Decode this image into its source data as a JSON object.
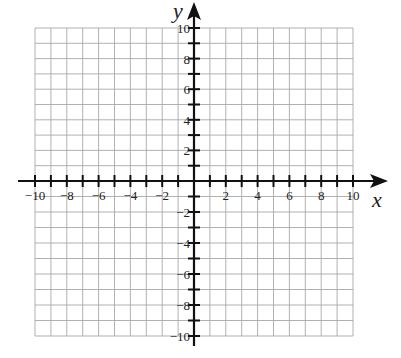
{
  "chart_data": {
    "type": "coordinate-grid",
    "title": "",
    "xlabel": "x",
    "ylabel": "y",
    "xlim": [
      -10,
      10
    ],
    "ylim": [
      -10,
      10
    ],
    "grid": true,
    "grid_step": 1,
    "x_tick_labels": [
      "-10",
      "-8",
      "-6",
      "-4",
      "-2",
      "2",
      "4",
      "6",
      "8",
      "10"
    ],
    "y_tick_labels": [
      "10",
      "8",
      "6",
      "4",
      "2",
      "-2",
      "-4",
      "-6",
      "-8",
      "-10"
    ],
    "series": []
  },
  "colors": {
    "grid": "#a8a8a8",
    "axis": "#111111",
    "text": "#222222"
  },
  "labels": {
    "x_axis": "x",
    "y_axis": "y"
  }
}
